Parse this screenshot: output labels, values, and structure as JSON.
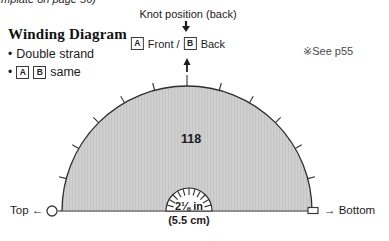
{
  "page": {
    "clipped_caption": "emplate on page 56)",
    "see_note": "※See p55"
  },
  "legend": {
    "title": "Winding Diagram",
    "items": [
      {
        "bullet": "•",
        "text": "Double strand",
        "boxes": []
      },
      {
        "bullet": "•",
        "text": "same",
        "boxes": [
          "A",
          "B"
        ]
      }
    ]
  },
  "knot": {
    "title": "Knot position (back)",
    "front_box": "A",
    "front_text": "Front /",
    "back_box": "B",
    "back_text": "Back"
  },
  "diagram": {
    "count_label": "118",
    "size_in": "2⅛ in",
    "size_cm": "(5.5 cm)",
    "left_label": "Top ←",
    "right_label": "→ Bottom",
    "colors": {
      "fill_base": "#d1d1d1",
      "fill_stripe": "#c3c3c3",
      "outline": "#2e2e2e",
      "baseline": "#8f8f8f",
      "tick": "#333333",
      "marker_stroke": "#3a3a3a",
      "arrow": "#1c1c1c"
    },
    "outer_tick_angles": [
      15,
      30,
      45,
      60,
      75,
      90,
      105,
      120,
      135,
      150,
      165
    ],
    "inner_tick_angles": [
      15,
      30,
      45,
      60,
      75,
      90,
      105,
      120,
      135,
      150,
      165
    ]
  }
}
